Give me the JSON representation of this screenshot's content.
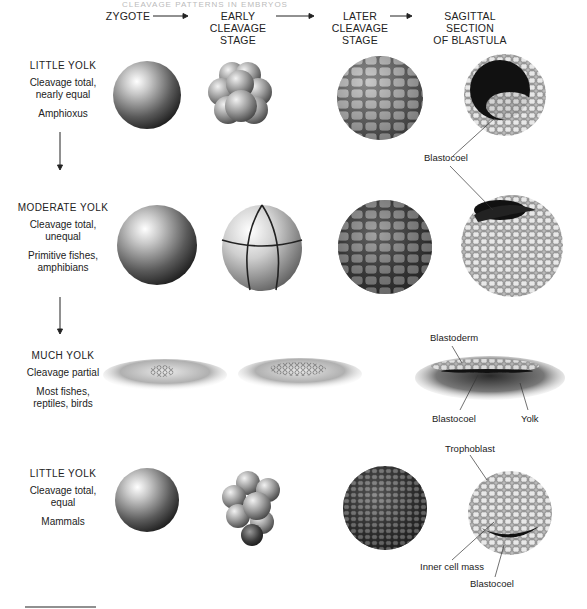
{
  "running_head": "CLEAVAGE PATTERNS IN EMBRYOS",
  "columns": [
    {
      "id": "zygote",
      "label_lines": [
        "ZYGOTE"
      ]
    },
    {
      "id": "early",
      "label_lines": [
        "EARLY CLEAVAGE",
        "STAGE"
      ]
    },
    {
      "id": "later",
      "label_lines": [
        "LATER CLEAVAGE",
        "STAGE"
      ]
    },
    {
      "id": "blastula",
      "label_lines": [
        "SAGITTAL SECTION",
        "OF BLASTULA"
      ]
    }
  ],
  "rows": [
    {
      "title": "LITTLE YOLK",
      "cleavage": [
        "Cleavage total,",
        "nearly equal"
      ],
      "examples": [
        "Amphioxus"
      ],
      "annotations": []
    },
    {
      "title": "MODERATE YOLK",
      "cleavage": [
        "Cleavage total,",
        "unequal"
      ],
      "examples": [
        "Primitive fishes,",
        "amphibians"
      ],
      "annotations": [
        "Blastocoel"
      ]
    },
    {
      "title": "MUCH YOLK",
      "cleavage": [
        "Cleavage partial"
      ],
      "examples": [
        "Most fishes,",
        "reptiles, birds"
      ],
      "annotations": [
        "Blastoderm",
        "Blastocoel",
        "Yolk"
      ]
    },
    {
      "title": "LITTLE YOLK",
      "cleavage": [
        "Cleavage total,",
        "equal"
      ],
      "examples": [
        "Mammals"
      ],
      "annotations": [
        "Trophoblast",
        "Inner cell mass",
        "Blastocoel"
      ]
    }
  ],
  "colors": {
    "ink": "#1a1a1a",
    "shade_dark": "#2a2a2a",
    "shade_mid": "#8a8a8a",
    "shade_light": "#e6e6e6"
  }
}
